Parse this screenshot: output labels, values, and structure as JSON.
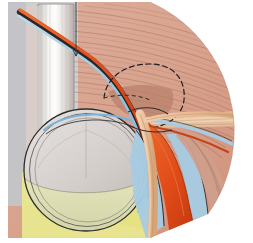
{
  "figure": {
    "caption": "",
    "width": 253,
    "height": 243,
    "background_color": "#ffffff",
    "view": "parasagittal cutaway fan section of the orbit"
  },
  "palette": {
    "background": "#ffffff",
    "muscle_salmon": "#d7a18f",
    "muscle_salmon_light": "#e3b6a4",
    "muscle_salmon_dark": "#c08874",
    "muscle_stripe": "#9a6352",
    "artery_red": "#e04a18",
    "artery_red_dark": "#b3330d",
    "artery_line": "#c5421a",
    "vein_blue": "#a6cbe3",
    "vein_blue_line": "#7fb2d6",
    "nerve_tan": "#e8bb95",
    "nerve_tan_line": "#c9935f",
    "bone_gray": "#d2d2d4",
    "bone_gray_light": "#ececee",
    "tube_white": "#f7f7f7",
    "globe_gray": "#d8d4d3",
    "globe_inner": "#c9c2c0",
    "vitreous_yellow": "#dfe0b4",
    "fat_yellow": "#e9e78e",
    "outline_dark": "#2c2c2c",
    "dashed_outline": "#1f1f1f",
    "panel_gray": "#cfd0d2",
    "wedge_tan": "#e5c6a3"
  },
  "structures": [
    {
      "id": "cranial-fan-section",
      "label": "Cranial fan section",
      "color": "#d7a18f",
      "description": "Large quarter-circle striated muscle/tissue field forming the body of the figure"
    },
    {
      "id": "temporalis-striations",
      "label": "Striated muscle fibers",
      "color": "#9a6352",
      "count": 34,
      "description": "Fine radiating fiber lines across the fan"
    },
    {
      "id": "bone-panel",
      "label": "Bone panel",
      "color": "#cfd0d2",
      "description": "Light gray rectangular bone wall at upper left"
    },
    {
      "id": "bone-tube",
      "label": "Cylindrical bone canal",
      "color": "#f7f7f7",
      "description": "Vertical cylinder with rounded inferior tip running down the left side"
    },
    {
      "id": "eye-globe",
      "label": "Eye globe",
      "color": "#d8d4d3",
      "description": "Large sphere at lower left with concentric scleral outlines"
    },
    {
      "id": "vitreous-chamber",
      "label": "Vitreous chamber",
      "color": "#dfe0b4",
      "description": "Pale yellow-green interior of the inferior globe"
    },
    {
      "id": "orbital-fat",
      "label": "Orbital fat",
      "color": "#e9e78e",
      "description": "Yellow adipose region below and behind the globe"
    },
    {
      "id": "artery",
      "label": "Artery",
      "color": "#e04a18",
      "description": "Bright orange-red vessel looping from upper left across to lower right"
    },
    {
      "id": "vein",
      "label": "Vein",
      "color": "#a6cbe3",
      "description": "Light blue vessel running parallel to the artery"
    },
    {
      "id": "nerve",
      "label": "Nerve",
      "color": "#e8bb95",
      "description": "Tan cord descending through the lower right quadrant"
    },
    {
      "id": "dashed-region",
      "label": "Dashed outline region",
      "color": "#1f1f1f",
      "description": "Dome-shaped dashed boundary marking a hidden structure in the mid-upper field"
    },
    {
      "id": "leader-line",
      "label": "Leader line",
      "color": "#3a3a3a",
      "description": "Thin vertical pointer line descending from the top edge"
    },
    {
      "id": "tendon-wedge",
      "label": "Tendon wedge",
      "color": "#e5c6a3",
      "description": "Pale tan wedge fanning toward the right margin"
    }
  ],
  "annotations": {
    "labels": [],
    "leader_lines": 1,
    "dashed_outlines": 1
  }
}
